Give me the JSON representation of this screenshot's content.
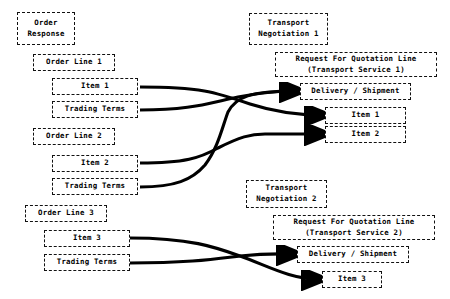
{
  "diagram": {
    "background_color": "#ffffff",
    "line_color": "#000000",
    "box_border_color": "#111111",
    "box_border_style": "dashed",
    "nodes": {
      "order_response": "Order\nResponse",
      "order_line_1": "Order Line 1",
      "item_1_left": "Item 1",
      "trading_terms_1": "Trading Terms",
      "order_line_2": "Order Line 2",
      "item_2_left": "Item 2",
      "trading_terms_2": "Trading Terms",
      "order_line_3": "Order Line 3",
      "item_3_left": "Item 3",
      "trading_terms_3": "Trading Terms",
      "transport_negotiation_1": "Transport\nNegotiation 1",
      "rfq_line_1": "Request For Quotation Line\n(Transport Service 1)",
      "delivery_shipment_1": "Delivery / Shipment",
      "item_1_right": "Item 1",
      "item_2_right": "Item 2",
      "transport_negotiation_2": "Transport\nNegotiation 2",
      "rfq_line_2": "Request For Quotation Line\n(Transport Service 2)",
      "delivery_shipment_2": "Delivery / Shipment",
      "item_3_right": "Item 3"
    },
    "edges": [
      {
        "name": "item-1-to-item-1",
        "from": "item_1_left",
        "to": "item_1_right",
        "path": "M 140 87 C 200 87 215 92 250 104 C 275 112 295 115 321 115"
      },
      {
        "name": "trading-terms-1-to-delivery-shipment-1",
        "from": "trading_terms_1",
        "to": "delivery_shipment_1",
        "path": "M 140 110 C 190 110 205 104 238 97 C 268 91 285 91 296 91"
      },
      {
        "name": "item-2-to-item-2",
        "from": "item_2_left",
        "to": "item_2_right",
        "path": "M 140 163 C 185 163 200 158 218 148 C 240 137 250 134 265 134 C 290 134 300 134 321 134"
      },
      {
        "name": "trading-terms-2-to-delivery-shipment-1",
        "from": "trading_terms_2",
        "to": "delivery_shipment_1",
        "path": "M 140 187 C 175 187 192 180 205 165 C 218 148 222 128 228 112 C 236 97 250 91 296 91"
      },
      {
        "name": "item-3-to-item-3",
        "from": "item_3_left",
        "to": "item_3_right",
        "path": "M 130 238 C 190 238 215 247 240 256 C 268 266 290 279 318 279"
      },
      {
        "name": "trading-terms-3-to-delivery-shipment-2",
        "from": "trading_terms_3",
        "to": "delivery_shipment_2",
        "path": "M 130 263 C 190 263 215 259 240 256 C 268 253 285 254 293 254"
      }
    ]
  }
}
